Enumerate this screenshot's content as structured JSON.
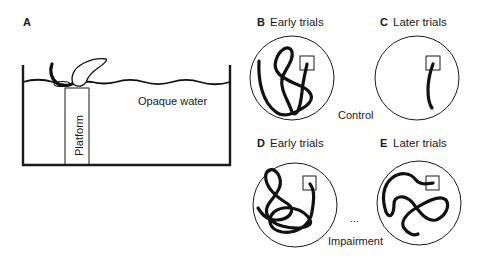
{
  "figure": {
    "panel_a": {
      "letter": "A",
      "water_label": "Opaque water",
      "platform_label": "Platform"
    },
    "panel_b": {
      "letter": "B",
      "title": "Early trials"
    },
    "panel_c": {
      "letter": "C",
      "title": "Later trials"
    },
    "panel_d": {
      "letter": "D",
      "title": "Early trials"
    },
    "panel_e": {
      "letter": "E",
      "title": "Later trials"
    },
    "group_labels": {
      "control": "Control",
      "impairment": "Impairment"
    },
    "ellipsis": "..."
  }
}
